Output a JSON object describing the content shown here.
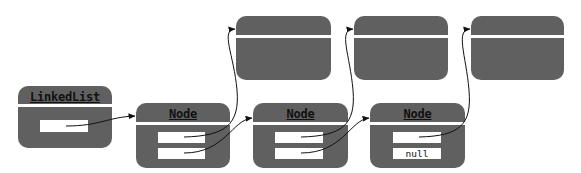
{
  "diagram": {
    "type": "linked-list",
    "colors": {
      "box_fill": "#606060",
      "divider": "#ffffff",
      "field_fill": "#ffffff",
      "arrow": "#111111",
      "title_text": "#111111"
    },
    "linked_list": {
      "title": "LinkedList",
      "fields": [
        {
          "value": ""
        }
      ]
    },
    "nodes": [
      {
        "title": "Node",
        "fields": [
          {
            "value": ""
          },
          {
            "value": ""
          }
        ]
      },
      {
        "title": "Node",
        "fields": [
          {
            "value": ""
          },
          {
            "value": ""
          }
        ]
      },
      {
        "title": "Node",
        "fields": [
          {
            "value": ""
          },
          {
            "value": "null"
          }
        ]
      }
    ],
    "data_objects": [
      {
        "title": ""
      },
      {
        "title": ""
      },
      {
        "title": ""
      }
    ],
    "edges": [
      {
        "from": "LinkedList.field0",
        "to": "Node1"
      },
      {
        "from": "Node1.field0",
        "to": "Object1"
      },
      {
        "from": "Node1.field1",
        "to": "Node2"
      },
      {
        "from": "Node2.field0",
        "to": "Object2"
      },
      {
        "from": "Node2.field1",
        "to": "Node3"
      },
      {
        "from": "Node3.field0",
        "to": "Object3"
      }
    ]
  }
}
